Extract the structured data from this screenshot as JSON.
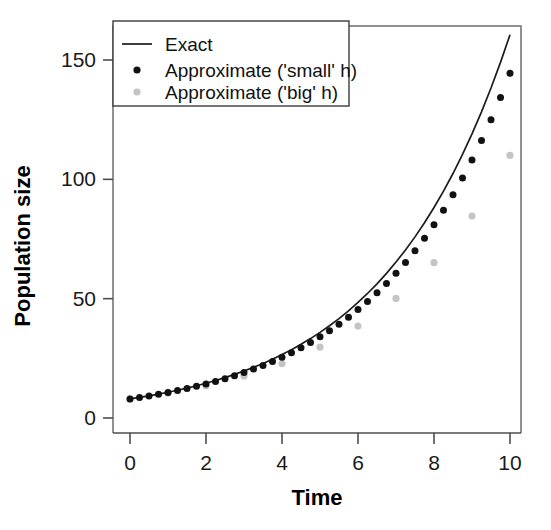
{
  "chart_data": {
    "type": "line",
    "title": "",
    "xlabel": "Time",
    "ylabel": "Population size",
    "xlim": [
      -0.25,
      10.5
    ],
    "ylim": [
      -4,
      168
    ],
    "xticks": [
      0,
      2,
      4,
      6,
      8,
      10
    ],
    "yticks": [
      0,
      50,
      100,
      150
    ],
    "grid": false,
    "legend_position": "top-left",
    "series": [
      {
        "name": "Exact",
        "marker": "line",
        "color": "#1c1c1c",
        "x": [
          0,
          0.25,
          0.5,
          0.75,
          1,
          1.25,
          1.5,
          1.75,
          2,
          2.25,
          2.5,
          2.75,
          3,
          3.25,
          3.5,
          3.75,
          4,
          4.25,
          4.5,
          4.75,
          5,
          5.25,
          5.5,
          5.75,
          6,
          6.25,
          6.5,
          6.75,
          7,
          7.25,
          7.5,
          7.75,
          8,
          8.25,
          8.5,
          8.75,
          9,
          9.25,
          9.5,
          9.75,
          10
        ],
        "y": [
          8,
          8.62,
          9.3,
          10.02,
          10.8,
          11.64,
          12.55,
          13.53,
          14.58,
          15.72,
          16.94,
          18.26,
          19.68,
          21.21,
          22.87,
          24.65,
          26.57,
          28.64,
          30.87,
          33.27,
          35.86,
          38.65,
          41.66,
          44.91,
          48.4,
          52.17,
          56.23,
          60.61,
          65.33,
          70.42,
          75.89,
          81.81,
          88.18,
          95.04,
          102.44,
          110.42,
          119.01,
          128.27,
          138.26,
          149.01,
          160.6
        ]
      },
      {
        "name": "Approximate ('small' h)",
        "marker": "dot",
        "color": "#111111",
        "x": [
          0,
          0.25,
          0.5,
          0.75,
          1,
          1.25,
          1.5,
          1.75,
          2,
          2.25,
          2.5,
          2.75,
          3,
          3.25,
          3.5,
          3.75,
          4,
          4.25,
          4.5,
          4.75,
          5,
          5.25,
          5.5,
          5.75,
          6,
          6.25,
          6.5,
          6.75,
          7,
          7.25,
          7.5,
          7.75,
          8,
          8.25,
          8.5,
          8.75,
          9,
          9.25,
          9.5,
          9.75,
          10
        ],
        "y": [
          8,
          8.6,
          9.25,
          9.94,
          10.69,
          11.49,
          12.35,
          13.28,
          14.27,
          15.34,
          16.49,
          17.73,
          19.06,
          20.49,
          22.03,
          23.68,
          25.46,
          27.37,
          29.42,
          31.63,
          34.0,
          36.55,
          39.29,
          42.24,
          45.41,
          48.81,
          52.47,
          56.4,
          60.63,
          65.18,
          70.06,
          75.32,
          80.97,
          87.04,
          93.57,
          100.59,
          108.13,
          116.24,
          124.96,
          134.33,
          144.4
        ]
      },
      {
        "name": "Approximate ('big' h)",
        "marker": "dot",
        "color": "#c4c4c4",
        "x": [
          0,
          1,
          2,
          3,
          4,
          5,
          6,
          7,
          8,
          9,
          10
        ],
        "y": [
          8,
          10.4,
          13.5,
          17.6,
          22.8,
          29.7,
          38.5,
          50.1,
          65.1,
          84.6,
          110.0
        ]
      }
    ]
  },
  "axis": {
    "x_title": "Time",
    "y_title": "Population size",
    "x_tick_labels": [
      "0",
      "2",
      "4",
      "6",
      "8",
      "10"
    ],
    "y_tick_labels": [
      "0",
      "50",
      "100",
      "150"
    ]
  },
  "legend": {
    "entries": [
      {
        "label": "Exact",
        "marker": "line",
        "color": "#1c1c1c"
      },
      {
        "label": "Approximate ('small' h)",
        "marker": "dot",
        "color": "#111111"
      },
      {
        "label": "Approximate ('big' h)",
        "marker": "dot",
        "color": "#c4c4c4"
      }
    ]
  }
}
